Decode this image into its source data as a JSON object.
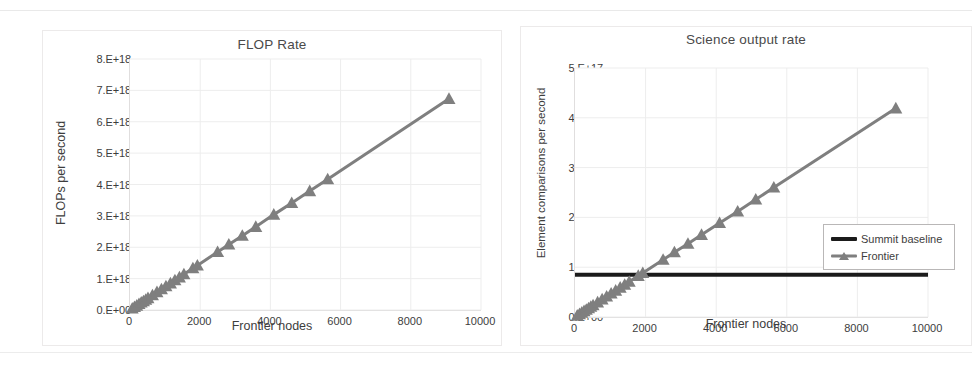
{
  "figure": {
    "background": "#ffffff",
    "charts": [
      {
        "id": "flop",
        "title": "FLOP Rate",
        "xlabel": "Frontier nodes",
        "ylabel": "FLOPs per second"
      },
      {
        "id": "science",
        "title": "Science output rate",
        "xlabel": "Frontier nodes",
        "ylabel": "Element comparisons per second"
      }
    ]
  },
  "legend": {
    "position": "center-right inside plot",
    "entries": [
      {
        "label": "Summit baseline",
        "color": "#1b1b1b",
        "style": "line",
        "marker": "none"
      },
      {
        "label": "Frontier",
        "color": "#7f7f7f",
        "style": "line",
        "marker": "triangle"
      }
    ]
  },
  "colors": {
    "frontier": "#7f7f7f",
    "summit": "#1b1b1b",
    "gridline": "#ededed",
    "axis": "#d9d7d7",
    "text": "#3d3d3d",
    "card_border": "#eceaea"
  },
  "chart_data": [
    {
      "type": "line",
      "id": "flop",
      "title": "FLOP Rate",
      "xlabel": "Frontier nodes",
      "ylabel": "FLOPs per second",
      "xlim": [
        0,
        10000
      ],
      "ylim": [
        0,
        8e+18
      ],
      "xticks": [
        0,
        2000,
        4000,
        6000,
        8000,
        10000
      ],
      "xticklabels": [
        "0",
        "2000",
        "4000",
        "6000",
        "8000",
        "10000"
      ],
      "yticks": [
        0,
        1e+18,
        2e+18,
        3e+18,
        4e+18,
        5e+18,
        6e+18,
        7e+18,
        8e+18
      ],
      "yticklabels": [
        "0.E+00",
        "1.E+18",
        "2.E+18",
        "3.E+18",
        "4.E+18",
        "5.E+18",
        "6.E+18",
        "7.E+18",
        "8.E+18"
      ],
      "grid": true,
      "legend": false,
      "series": [
        {
          "name": "Frontier",
          "color": "#7f7f7f",
          "marker": "triangle",
          "x": [
            64,
            128,
            192,
            256,
            320,
            384,
            448,
            512,
            640,
            768,
            896,
            1024,
            1152,
            1280,
            1408,
            1536,
            1792,
            1920,
            2496,
            2816,
            3200,
            3584,
            4096,
            4608,
            5120,
            5632,
            9088
          ],
          "y": [
            4.7e+16,
            9.5e+16,
            1.4e+17,
            1.9e+17,
            2.4e+17,
            2.8e+17,
            3.3e+17,
            3.8e+17,
            4.7e+17,
            5.7e+17,
            6.6e+17,
            7.6e+17,
            8.5e+17,
            9.5e+17,
            1.04e+18,
            1.14e+18,
            1.33e+18,
            1.42e+18,
            1.85e+18,
            2.09e+18,
            2.37e+18,
            2.65e+18,
            3.04e+18,
            3.41e+18,
            3.79e+18,
            4.17e+18,
            6.73e+18
          ]
        }
      ]
    },
    {
      "type": "line",
      "id": "science",
      "title": "Science output rate",
      "xlabel": "Frontier nodes",
      "ylabel": "Element comparisons per second",
      "xlim": [
        0,
        10000
      ],
      "ylim": [
        0,
        5e+17
      ],
      "xticks": [
        0,
        2000,
        4000,
        6000,
        8000,
        10000
      ],
      "xticklabels": [
        "0",
        "2000",
        "4000",
        "6000",
        "8000",
        "10000"
      ],
      "yticks": [
        0,
        1e+17,
        2e+17,
        3e+17,
        4e+17,
        5e+17
      ],
      "yticklabels": [
        "0.E+00",
        "1.E+17",
        "2.E+17",
        "3.E+17",
        "4.E+17",
        "5.E+17"
      ],
      "grid": true,
      "legend": true,
      "series": [
        {
          "name": "Summit baseline",
          "color": "#1b1b1b",
          "marker": "none",
          "x": [
            0,
            10000
          ],
          "y": [
            8.5e+16,
            8.5e+16
          ]
        },
        {
          "name": "Frontier",
          "color": "#7f7f7f",
          "marker": "triangle",
          "x": [
            64,
            128,
            192,
            256,
            320,
            384,
            448,
            512,
            640,
            768,
            896,
            1024,
            1152,
            1280,
            1408,
            1536,
            1792,
            1920,
            2496,
            2816,
            3200,
            3584,
            4096,
            4608,
            5120,
            5632,
            9088
          ],
          "y": [
            2900000000000000.0,
            5900000000000000.0,
            8800000000000000.0,
            1.18e+16,
            1.47e+16,
            1.77e+16,
            2.06e+16,
            2.36e+16,
            2.95e+16,
            3.54e+16,
            4.13e+16,
            4.72e+16,
            5.31e+16,
            5.9e+16,
            6.49e+16,
            7.08e+16,
            8.26e+16,
            8.85e+16,
            1.15e+17,
            1.3e+17,
            1.47e+17,
            1.65e+17,
            1.89e+17,
            2.12e+17,
            2.36e+17,
            2.6e+17,
            4.19e+17
          ]
        }
      ]
    }
  ]
}
